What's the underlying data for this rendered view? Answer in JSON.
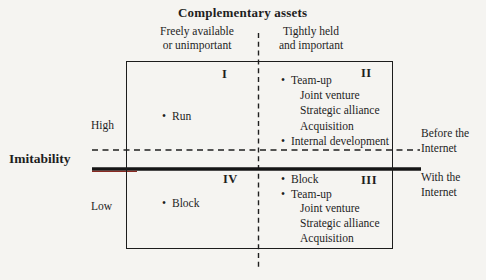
{
  "title": "Complementary assets",
  "columns": {
    "left": {
      "line1": "Freely available",
      "line2": "or unimportant"
    },
    "right": {
      "line1": "Tightly held",
      "line2": "and important"
    }
  },
  "y_axis": {
    "label": "Imitability",
    "high": "High",
    "low": "Low"
  },
  "quadrants": {
    "I": {
      "numeral": "I",
      "items": [
        {
          "marker": "•",
          "label": "Run"
        }
      ]
    },
    "II": {
      "numeral": "II",
      "items": [
        {
          "marker": "•",
          "label": "Team-up"
        },
        {
          "marker": "",
          "label": "Joint venture"
        },
        {
          "marker": "",
          "label": "Strategic alliance"
        },
        {
          "marker": "",
          "label": "Acquisition"
        },
        {
          "marker": "•",
          "label": "Internal development"
        }
      ]
    },
    "III": {
      "numeral": "III",
      "items": [
        {
          "marker": "•",
          "label": "Block"
        },
        {
          "marker": "•",
          "label": "Team-up"
        },
        {
          "marker": "",
          "label": "Joint venture"
        },
        {
          "marker": "",
          "label": "Strategic alliance"
        },
        {
          "marker": "",
          "label": "Acquisition"
        }
      ]
    },
    "IV": {
      "numeral": "IV",
      "items": [
        {
          "marker": "•",
          "label": "Block"
        }
      ]
    }
  },
  "era_labels": {
    "before": {
      "line1": "Before the",
      "line2": "Internet"
    },
    "with": {
      "line1": "With the",
      "line2": "Internet"
    }
  },
  "colors": {
    "text": "#1e1e1e",
    "line": "#1f1f1f",
    "solid_line": "#151515",
    "accent_red": "#8a2a22",
    "background": "#f5f4f1"
  }
}
